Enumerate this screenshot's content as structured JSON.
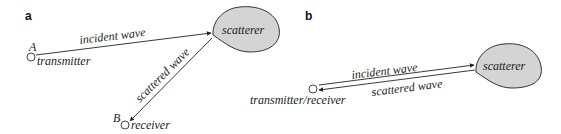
{
  "panel_a": {
    "label": "a",
    "point_a_label": "A",
    "transmitter_label": "transmitter",
    "point_b_label": "B",
    "receiver_label": "receiver",
    "scatterer_label": "scatterer",
    "incident_wave_label": "incident wave",
    "scattered_wave_label": "scattered wave"
  },
  "panel_b": {
    "label": "b",
    "transceiver_label": "transmitter/receiver",
    "scatterer_label": "scatterer",
    "incident_wave_label": "incident wave",
    "scattered_wave_label": "scattered wave"
  },
  "colors": {
    "scatterer_fill": "#d4d4d4",
    "stroke": "#222222"
  }
}
